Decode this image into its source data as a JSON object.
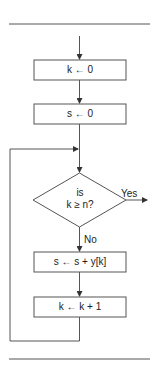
{
  "flowchart": {
    "steps": [
      {
        "id": "init-k",
        "type": "process",
        "text": "k ← 0"
      },
      {
        "id": "init-s",
        "type": "process",
        "text": "s ← 0"
      },
      {
        "id": "condition",
        "type": "decision",
        "line1": "is",
        "line2": "k ≥ n?"
      },
      {
        "id": "accumulate",
        "type": "process",
        "text": "s ← s + y[k]"
      },
      {
        "id": "increment",
        "type": "process",
        "text": "k ← k + 1"
      }
    ],
    "yes_label": "Yes",
    "no_label": "No"
  }
}
